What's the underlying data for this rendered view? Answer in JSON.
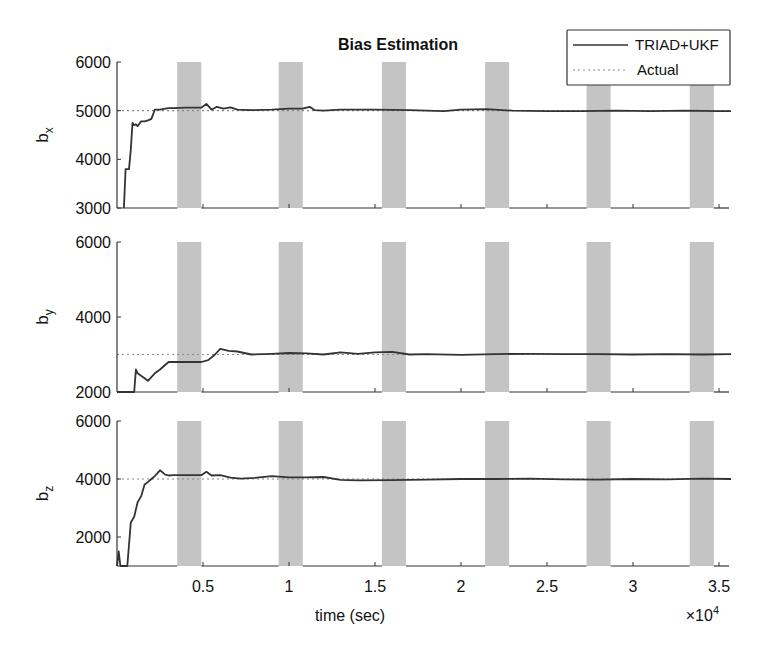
{
  "chart_data": {
    "type": "line",
    "title": "Bias Estimation",
    "xlabel": "time (sec)",
    "x_multiplier": "×10^4",
    "x_multiplier_base": "×10",
    "x_multiplier_exp": "4",
    "xlim": [
      0,
      3.57
    ],
    "xticks": [
      0.5,
      1,
      1.5,
      2,
      2.5,
      3,
      3.5
    ],
    "xtick_labels": [
      "0.5",
      "1",
      "1.5",
      "2",
      "2.5",
      "3",
      "3.5"
    ],
    "legend": {
      "position": "top-right",
      "entries": [
        {
          "label": "TRIAD+UKF",
          "style": "solid"
        },
        {
          "label": "Actual",
          "style": "dotted"
        }
      ]
    },
    "shaded_intervals": [
      [
        0.35,
        0.49
      ],
      [
        0.94,
        1.08
      ],
      [
        1.54,
        1.68
      ],
      [
        2.14,
        2.28
      ],
      [
        2.73,
        2.87
      ],
      [
        3.33,
        3.47
      ]
    ],
    "panels": [
      {
        "ylabel": "b",
        "ylabel_sub": "x",
        "ylim": [
          3000,
          6000
        ],
        "yticks": [
          3000,
          4000,
          5000,
          6000
        ],
        "ytick_labels": [
          "3000",
          "4000",
          "5000",
          "6000"
        ],
        "actual": 5000,
        "series": {
          "name": "TRIAD+UKF",
          "x": [
            0.04,
            0.05,
            0.07,
            0.08,
            0.09,
            0.1,
            0.11,
            0.12,
            0.14,
            0.16,
            0.18,
            0.2,
            0.22,
            0.25,
            0.28,
            0.3,
            0.33,
            0.4,
            0.49,
            0.52,
            0.55,
            0.58,
            0.62,
            0.66,
            0.7,
            0.78,
            0.9,
            1.0,
            1.08,
            1.12,
            1.15,
            1.2,
            1.3,
            1.5,
            1.7,
            1.9,
            2.0,
            2.15,
            2.3,
            2.5,
            2.7,
            2.9,
            3.1,
            3.3,
            3.5,
            3.57
          ],
          "y": [
            3000,
            3800,
            3800,
            4200,
            4750,
            4700,
            4720,
            4680,
            4780,
            4780,
            4800,
            4830,
            5020,
            5020,
            5040,
            5050,
            5050,
            5060,
            5060,
            5140,
            5020,
            5080,
            5040,
            5070,
            5020,
            5010,
            5020,
            5040,
            5040,
            5080,
            5010,
            5000,
            5020,
            5020,
            5010,
            4990,
            5020,
            5030,
            5000,
            4990,
            4990,
            5000,
            4990,
            5000,
            4990,
            4990
          ]
        }
      },
      {
        "ylabel": "b",
        "ylabel_sub": "y",
        "ylim": [
          2000,
          6000
        ],
        "yticks": [
          2000,
          4000,
          6000
        ],
        "ytick_labels": [
          "2000",
          "4000",
          "6000"
        ],
        "actual": 3000,
        "series": {
          "name": "TRIAD+UKF",
          "x": [
            0.0,
            0.1,
            0.11,
            0.12,
            0.18,
            0.22,
            0.25,
            0.3,
            0.35,
            0.49,
            0.53,
            0.57,
            0.6,
            0.65,
            0.7,
            0.78,
            0.9,
            1.0,
            1.1,
            1.2,
            1.3,
            1.4,
            1.5,
            1.6,
            1.7,
            1.8,
            2.0,
            2.2,
            2.4,
            2.6,
            2.8,
            3.0,
            3.2,
            3.4,
            3.57
          ],
          "y": [
            2000,
            2000,
            2600,
            2500,
            2300,
            2500,
            2600,
            2800,
            2800,
            2800,
            2850,
            3000,
            3150,
            3100,
            3080,
            3000,
            3020,
            3040,
            3030,
            3000,
            3060,
            3020,
            3060,
            3070,
            3000,
            3010,
            2990,
            3010,
            3020,
            3010,
            3010,
            3000,
            3010,
            3000,
            3010
          ]
        }
      },
      {
        "ylabel": "b",
        "ylabel_sub": "z",
        "ylim": [
          1000,
          6000
        ],
        "yticks": [
          2000,
          4000,
          6000
        ],
        "ytick_labels": [
          "2000",
          "4000",
          "6000"
        ],
        "actual": 4000,
        "series": {
          "name": "TRIAD+UKF",
          "x": [
            0.0,
            0.01,
            0.02,
            0.04,
            0.06,
            0.08,
            0.1,
            0.12,
            0.14,
            0.16,
            0.18,
            0.2,
            0.22,
            0.25,
            0.28,
            0.3,
            0.33,
            0.4,
            0.49,
            0.52,
            0.55,
            0.6,
            0.66,
            0.72,
            0.8,
            0.9,
            1.0,
            1.1,
            1.2,
            1.3,
            1.4,
            1.6,
            1.8,
            2.0,
            2.2,
            2.4,
            2.6,
            2.8,
            3.0,
            3.2,
            3.4,
            3.57
          ],
          "y": [
            1000,
            1500,
            1000,
            1000,
            1000,
            2500,
            2700,
            3200,
            3400,
            3800,
            3900,
            4000,
            4100,
            4300,
            4150,
            4120,
            4130,
            4130,
            4130,
            4250,
            4120,
            4130,
            4050,
            4010,
            4040,
            4100,
            4060,
            4060,
            4070,
            3970,
            3950,
            3960,
            3980,
            4000,
            4000,
            4010,
            3990,
            3980,
            4000,
            3990,
            4010,
            4000
          ]
        }
      }
    ]
  }
}
